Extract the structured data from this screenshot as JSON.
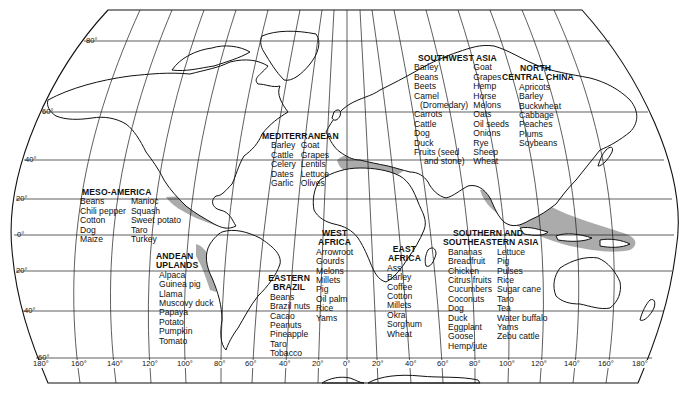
{
  "map": {
    "shade_color": "#a6a6a6",
    "latitude_labels": [
      "80°",
      "60°",
      "40°",
      "20°",
      "0°",
      "20°",
      "40°",
      "60°"
    ],
    "longitude_labels": [
      "180°",
      "160°",
      "140°",
      "120°",
      "100°",
      "80°",
      "60°",
      "40°",
      "20°",
      "0°",
      "20°",
      "40°",
      "60°",
      "80°",
      "100°",
      "120°",
      "140°",
      "160°",
      "180°"
    ]
  },
  "regions": {
    "meso_america": {
      "title": "MESO-AMERICA",
      "col1": [
        "Beans",
        "Chili pepper",
        "Cotton",
        "Dog",
        "Maize"
      ],
      "col2": [
        "Manioc",
        "Squash",
        "Sweet potato",
        "Taro",
        "Turkey"
      ]
    },
    "andean_uplands": {
      "title1": "ANDEAN",
      "title2": "UPLANDS",
      "items": [
        "Alpaca",
        "Guinea pig",
        "Llama",
        "Muscovy duck",
        "Papaya",
        "Potato",
        "Pumpkin",
        "Tomato"
      ]
    },
    "eastern_brazil": {
      "title1": "EASTERN",
      "title2": "BRAZIL",
      "items": [
        "Beans",
        "Brazil nuts",
        "Cacao",
        "Peanuts",
        "Pineapple",
        "Taro",
        "Tobacco"
      ]
    },
    "mediterranean": {
      "title": "MEDITERRANEAN",
      "col1": [
        "Barley",
        "Cattle",
        "Celery",
        "Dates",
        "Garlic"
      ],
      "col2": [
        "Goat",
        "Grapes",
        "Lentils",
        "Lettuce",
        "Olives"
      ]
    },
    "west_africa": {
      "title1": "WEST",
      "title2": "AFRICA",
      "items": [
        "Arrowroot",
        "Gourds",
        "Melons",
        "Millets",
        "Pig",
        "Oil palm",
        "Rice",
        "Yams"
      ]
    },
    "east_africa": {
      "title1": "EAST",
      "title2": "AFRICA",
      "items": [
        "Ass",
        "Barley",
        "Coffee",
        "Cotton",
        "Millets",
        "Okra",
        "Sorghum",
        "Wheat"
      ]
    },
    "southwest_asia": {
      "title": "SOUTHWEST ASIA",
      "col1": [
        "Barley",
        "Beans",
        "Beets",
        "Camel",
        "(Dromedary)",
        "Carrots",
        "Cattle",
        "Dog",
        "Duck",
        "Fruits (seed",
        "and stone)"
      ],
      "col2": [
        "Goat",
        "Grapes",
        "Hemp",
        "Horse",
        "Melons",
        "Oats",
        "Oil seeds",
        "Onions",
        "Rye",
        "Sheep",
        "Wheat"
      ]
    },
    "north_central_china": {
      "title1": "NORTH",
      "title2": "CENTRAL CHINA",
      "items": [
        "Apricots",
        "Barley",
        "Buckwheat",
        "Cabbage",
        "Peaches",
        "Plums",
        "Soybeans"
      ]
    },
    "southern_southeastern_asia": {
      "title1": "SOUTHERN AND",
      "title2": "SOUTHEASTERN ASIA",
      "col1": [
        "Bananas",
        "Breadfruit",
        "Chicken",
        "Citrus fruits",
        "Cucumbers",
        "Coconuts",
        "Dog",
        "Duck",
        "Eggplant",
        "Goose",
        "Hemp/jute"
      ],
      "col2": [
        "Lettuce",
        "Pig",
        "Pulses",
        "Rice",
        "Sugar cane",
        "Taro",
        "Tea",
        "Water buffalo",
        "Yams",
        "Zebu cattle"
      ]
    }
  }
}
